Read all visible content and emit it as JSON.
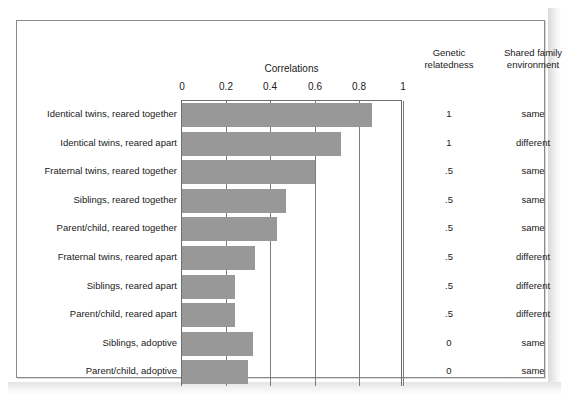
{
  "figure": {
    "axis_title": "Correlations",
    "headers": {
      "genetic": "Genetic\nrelatedness",
      "genetic_line1": "Genetic",
      "genetic_line2": "relatedness",
      "shared_line1": "Shared family",
      "shared_line2": "environment"
    },
    "bar_color": "#989898",
    "frame_color": "#8a8a8a",
    "grid_color": "#7d7d7d"
  },
  "chart_data": {
    "type": "bar",
    "orientation": "horizontal",
    "title": "Correlations",
    "xlabel": "Correlations",
    "ylabel": "",
    "xlim": [
      0,
      1
    ],
    "grid": true,
    "legend": false,
    "tick_labels": [
      "0",
      "0.2",
      "0.4",
      "0.6",
      "0.8",
      "1"
    ],
    "tick_values": [
      0,
      0.2,
      0.4,
      0.6,
      0.8,
      1
    ],
    "categories": [
      "Identical twins, reared together",
      "Identical twins, reared apart",
      "Fraternal twins, reared together",
      "Siblings, reared together",
      "Parent/child, reared together",
      "Fraternal twins, reared apart",
      "Siblings, reared apart",
      "Parent/child, reared apart",
      "Siblings, adoptive",
      "Parent/child, adoptive"
    ],
    "values": [
      0.86,
      0.72,
      0.6,
      0.47,
      0.43,
      0.33,
      0.24,
      0.24,
      0.32,
      0.3
    ],
    "columns": [
      {
        "name": "Genetic relatedness",
        "values": [
          "1",
          "1",
          ".5",
          ".5",
          ".5",
          ".5",
          ".5",
          ".5",
          "0",
          "0"
        ]
      },
      {
        "name": "Shared family environment",
        "values": [
          "same",
          "different",
          "same",
          "same",
          "same",
          "different",
          "different",
          "different",
          "same",
          "same"
        ]
      }
    ]
  }
}
